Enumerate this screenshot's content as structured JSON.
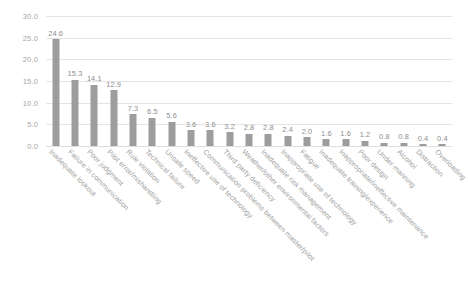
{
  "chart_data": {
    "type": "bar",
    "title": "",
    "subtitle": "",
    "xlabel": "",
    "ylabel": "",
    "ylim": [
      0.0,
      30.0
    ],
    "yticks": [
      "0.0",
      "5.0",
      "10.0",
      "15.0",
      "20.0",
      "25.0",
      "30.0"
    ],
    "ytick_values": [
      0.0,
      5.0,
      10.0,
      15.0,
      20.0,
      25.0,
      30.0
    ],
    "grid": true,
    "legend": false,
    "orientation": "vertical",
    "bar_color": "#9d9d9d",
    "gridline_color": "#e4e4e4",
    "label_color": "#a0a0a0",
    "data_label_color": "#8e8e8e",
    "categories": [
      "Inadequate lookout",
      "Failure in communication",
      "Poor judgment",
      "Pilot error/mishandling",
      "Rule violation",
      "Technical failure",
      "Unsafe speed",
      "Ineffective use of technology",
      "Communication problems between master/pilot",
      "Third party deficiency",
      "Weather/other environmental factors",
      "Inadequate risk management",
      "Inappropriate use of technology",
      "Fatigue",
      "Inadequate training/experience",
      "Inappropriate/ineffective maintenance",
      "Poor design",
      "Under-manning",
      "Alcohol",
      "Distraction",
      "Overloading"
    ],
    "values": [
      24.6,
      15.3,
      14.1,
      12.9,
      7.3,
      6.5,
      5.6,
      3.6,
      3.6,
      3.2,
      2.8,
      2.8,
      2.4,
      2.0,
      1.6,
      1.6,
      1.2,
      0.8,
      0.8,
      0.4,
      0.4
    ],
    "value_labels": [
      "24.6",
      "15.3",
      "14.1",
      "12.9",
      "7.3",
      "6.5",
      "5.6",
      "3.6",
      "3.6",
      "3.2",
      "2.8",
      "2.8",
      "2.4",
      "2.0",
      "1.6",
      "1.6",
      "1.2",
      "0.8",
      "0.8",
      "0.4",
      "0.4"
    ]
  }
}
